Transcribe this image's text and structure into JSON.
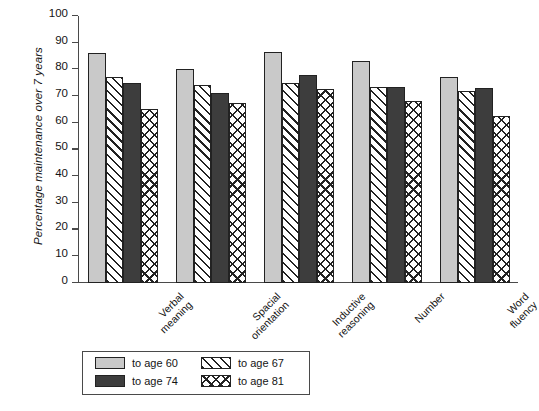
{
  "chart_data": {
    "type": "bar",
    "title": "",
    "xlabel": "",
    "ylabel": "Percentage maintenance over 7 years",
    "ylim": [
      0,
      100
    ],
    "ytick_labels": [
      "0",
      "10",
      "20",
      "30",
      "40",
      "50",
      "60",
      "70",
      "80",
      "90",
      "100"
    ],
    "ytick_values": [
      0,
      10,
      20,
      30,
      40,
      50,
      60,
      70,
      80,
      90,
      100
    ],
    "grid": false,
    "legend_position": "bottom-left-outside",
    "categories": [
      "Verbal meaning",
      "Spacial orientation",
      "Inductive reasoning",
      "Number",
      "Word fluency"
    ],
    "category_lines": [
      [
        "Verbal",
        "meaning"
      ],
      [
        "Spacial",
        "orientation"
      ],
      [
        "Inductive",
        "reasoning"
      ],
      [
        "Number"
      ],
      [
        "Word",
        "fluency"
      ]
    ],
    "series": [
      {
        "name": "to age 60",
        "pattern": "solid-light",
        "color": "#c9c9c9",
        "values": [
          86,
          80,
          86.5,
          83,
          77
        ]
      },
      {
        "name": "to age 67",
        "pattern": "diagonal",
        "color": "#ffffff",
        "values": [
          77,
          74,
          75,
          73.5,
          72
        ]
      },
      {
        "name": "to age 74",
        "pattern": "solid-dark",
        "color": "#3d3d3d",
        "values": [
          75,
          71,
          78,
          73.5,
          73
        ]
      },
      {
        "name": "to age 81",
        "pattern": "crosshatch",
        "color": "#ffffff",
        "values": [
          65,
          67.5,
          72.5,
          68,
          62.5
        ]
      }
    ]
  }
}
